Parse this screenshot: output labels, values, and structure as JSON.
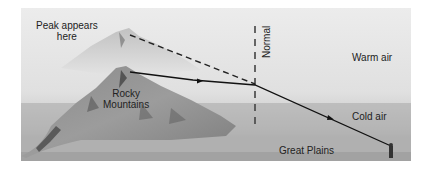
{
  "figure": {
    "labels": {
      "peak_appears": [
        "Peak appears",
        "here"
      ],
      "normal": "Normal",
      "warm_air": "Warm air",
      "rocky_mountains": [
        "Rocky",
        "Mountains"
      ],
      "cold_air": "Cold air",
      "great_plains": "Great Plains"
    },
    "colors": {
      "sky_top": "#e6e6e6",
      "sky_bottom": "#bdbdbd",
      "cold_band": "#9e9e9e",
      "plains": "#b3b3b3",
      "ray_line": "#111111"
    }
  }
}
